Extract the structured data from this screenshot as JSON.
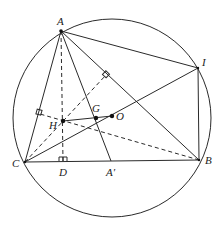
{
  "diagram": {
    "type": "geometry",
    "circle": {
      "cx": 112,
      "cy": 118,
      "r": 99
    },
    "points": {
      "A": {
        "label": "A",
        "x": 61,
        "y": 31
      },
      "I": {
        "label": "I",
        "x": 198,
        "y": 68
      },
      "B": {
        "label": "B",
        "x": 199,
        "y": 160
      },
      "C": {
        "label": "C",
        "x": 25,
        "y": 162
      },
      "D": {
        "label": "D",
        "x": 63,
        "y": 161
      },
      "A_prime": {
        "label": "A′",
        "x": 111,
        "y": 161
      },
      "H": {
        "label": "H",
        "x": 63,
        "y": 121
      },
      "G": {
        "label": "G",
        "x": 96,
        "y": 118
      },
      "O": {
        "label": "O",
        "x": 112,
        "y": 116
      },
      "foot_AB": {
        "x": 106,
        "y": 75
      },
      "foot_AC": {
        "x": 40,
        "y": 114
      }
    },
    "solid_segments": [
      [
        "A",
        "C"
      ],
      [
        "A",
        "B"
      ],
      [
        "A",
        "I"
      ],
      [
        "A",
        "A_prime"
      ],
      [
        "I",
        "B"
      ],
      [
        "I",
        "C"
      ],
      [
        "C",
        "B"
      ],
      [
        "H",
        "O"
      ]
    ],
    "dashed_segments": [
      [
        "A",
        "D"
      ],
      [
        "C",
        "foot_AB"
      ],
      [
        "B",
        "foot_AC"
      ]
    ],
    "right_angle_marks": [
      "D",
      "foot_AB",
      "foot_AC"
    ],
    "labels": {
      "A": "A",
      "I": "I",
      "B": "B",
      "C": "C",
      "D": "D",
      "A_prime": "A′",
      "H": "H",
      "G": "G",
      "O": "O"
    }
  }
}
